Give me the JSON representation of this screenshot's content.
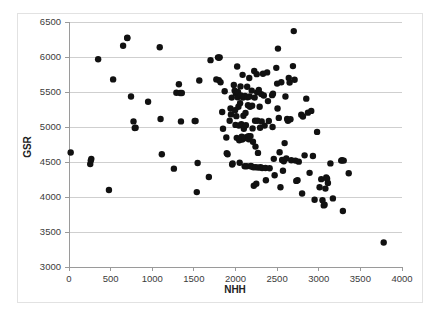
{
  "chart_data": {
    "type": "scatter",
    "title": "",
    "subtitle": "",
    "xlabel": "NHH",
    "ylabel": "GSR",
    "xlim": [
      0,
      4000
    ],
    "ylim": [
      3000,
      6500
    ],
    "xticks": [
      0,
      500,
      1000,
      1500,
      2000,
      2500,
      3000,
      3500,
      4000
    ],
    "yticks": [
      3000,
      3500,
      4000,
      4500,
      5000,
      5500,
      6000,
      6500
    ],
    "xtick_labels": [
      "0",
      "500",
      "1000",
      "1500",
      "2000",
      "2500",
      "3000",
      "3500",
      "4000"
    ],
    "ytick_labels": [
      "3000",
      "3500",
      "4000",
      "4500",
      "5000",
      "5500",
      "6000",
      "6500"
    ],
    "grid": "horizontal",
    "legend": "none",
    "marker": "filled-circle",
    "marker_color": "#111111",
    "marker_size": 3.2,
    "series": [
      {
        "name": "GSR vs NHH",
        "points": [
          [
            20,
            4635
          ],
          [
            255,
            4470
          ],
          [
            262,
            4520
          ],
          [
            268,
            4545
          ],
          [
            350,
            5968
          ],
          [
            480,
            4100
          ],
          [
            530,
            5680
          ],
          [
            650,
            6160
          ],
          [
            700,
            6275
          ],
          [
            700,
            6270
          ],
          [
            745,
            5435
          ],
          [
            775,
            5080
          ],
          [
            790,
            4985
          ],
          [
            800,
            4990
          ],
          [
            950,
            5360
          ],
          [
            1090,
            6140
          ],
          [
            1100,
            5115
          ],
          [
            1115,
            4610
          ],
          [
            1260,
            4405
          ],
          [
            1290,
            5490
          ],
          [
            1320,
            5610
          ],
          [
            1335,
            5485
          ],
          [
            1345,
            5080
          ],
          [
            1355,
            5485
          ],
          [
            1510,
            5085
          ],
          [
            1520,
            5085
          ],
          [
            1535,
            4070
          ],
          [
            1545,
            4485
          ],
          [
            1565,
            5665
          ],
          [
            1680,
            4285
          ],
          [
            1700,
            5955
          ],
          [
            1770,
            5680
          ],
          [
            1790,
            5995
          ],
          [
            1800,
            5990
          ],
          [
            1810,
            5995
          ],
          [
            1800,
            5670
          ],
          [
            1820,
            5640
          ],
          [
            1840,
            5215
          ],
          [
            1850,
            4975
          ],
          [
            1870,
            5510
          ],
          [
            1890,
            4850
          ],
          [
            1895,
            4625
          ],
          [
            1905,
            4610
          ],
          [
            1930,
            5090
          ],
          [
            1940,
            5265
          ],
          [
            1945,
            5180
          ],
          [
            1955,
            5420
          ],
          [
            1960,
            4465
          ],
          [
            1965,
            4480
          ],
          [
            1980,
            5600
          ],
          [
            1990,
            5520
          ],
          [
            1995,
            5240
          ],
          [
            2000,
            5030
          ],
          [
            2005,
            5480
          ],
          [
            2010,
            5155
          ],
          [
            2015,
            4845
          ],
          [
            2020,
            5865
          ],
          [
            2025,
            5425
          ],
          [
            2030,
            5500
          ],
          [
            2035,
            5290
          ],
          [
            2040,
            5020
          ],
          [
            2045,
            4810
          ],
          [
            2050,
            4490
          ],
          [
            2055,
            5340
          ],
          [
            2060,
            5580
          ],
          [
            2065,
            5450
          ],
          [
            2070,
            5040
          ],
          [
            2075,
            4860
          ],
          [
            2080,
            4820
          ],
          [
            2085,
            5745
          ],
          [
            2090,
            5420
          ],
          [
            2095,
            5160
          ],
          [
            2100,
            4975
          ],
          [
            2105,
            4840
          ],
          [
            2110,
            4440
          ],
          [
            2115,
            5445
          ],
          [
            2120,
            5200
          ],
          [
            2125,
            5025
          ],
          [
            2130,
            4855
          ],
          [
            2135,
            4440
          ],
          [
            2140,
            5575
          ],
          [
            2145,
            5425
          ],
          [
            2150,
            5310
          ],
          [
            2155,
            4870
          ],
          [
            2158,
            4835
          ],
          [
            2160,
            4825
          ],
          [
            2165,
            5700
          ],
          [
            2170,
            5435
          ],
          [
            2175,
            5290
          ],
          [
            2180,
            4870
          ],
          [
            2185,
            4445
          ],
          [
            2190,
            4435
          ],
          [
            2195,
            5520
          ],
          [
            2200,
            5305
          ],
          [
            2205,
            4980
          ],
          [
            2210,
            4790
          ],
          [
            2215,
            4425
          ],
          [
            2220,
            4160
          ],
          [
            2225,
            5800
          ],
          [
            2230,
            5420
          ],
          [
            2235,
            5090
          ],
          [
            2240,
            4720
          ],
          [
            2245,
            4425
          ],
          [
            2250,
            4190
          ],
          [
            2255,
            5755
          ],
          [
            2260,
            5495
          ],
          [
            2265,
            5090
          ],
          [
            2270,
            4630
          ],
          [
            2275,
            4420
          ],
          [
            2280,
            5530
          ],
          [
            2290,
            5290
          ],
          [
            2295,
            4990
          ],
          [
            2300,
            4425
          ],
          [
            2310,
            5470
          ],
          [
            2315,
            5080
          ],
          [
            2320,
            4415
          ],
          [
            2330,
            5760
          ],
          [
            2340,
            5450
          ],
          [
            2350,
            5020
          ],
          [
            2360,
            4415
          ],
          [
            2365,
            4240
          ],
          [
            2380,
            5780
          ],
          [
            2390,
            5370
          ],
          [
            2400,
            5085
          ],
          [
            2410,
            4410
          ],
          [
            2440,
            5455
          ],
          [
            2445,
            5000
          ],
          [
            2450,
            5475
          ],
          [
            2460,
            4545
          ],
          [
            2470,
            4310
          ],
          [
            2490,
            5845
          ],
          [
            2500,
            5620
          ],
          [
            2505,
            5265
          ],
          [
            2510,
            6120
          ],
          [
            2520,
            5130
          ],
          [
            2530,
            4640
          ],
          [
            2540,
            4140
          ],
          [
            2550,
            5640
          ],
          [
            2560,
            4530
          ],
          [
            2570,
            4375
          ],
          [
            2580,
            4510
          ],
          [
            2590,
            4770
          ],
          [
            2600,
            5435
          ],
          [
            2610,
            4550
          ],
          [
            2620,
            5115
          ],
          [
            2630,
            5090
          ],
          [
            2640,
            5700
          ],
          [
            2650,
            5635
          ],
          [
            2660,
            5110
          ],
          [
            2670,
            4525
          ],
          [
            2690,
            5870
          ],
          [
            2700,
            6370
          ],
          [
            2710,
            5675
          ],
          [
            2720,
            4520
          ],
          [
            2730,
            4230
          ],
          [
            2745,
            4240
          ],
          [
            2760,
            4505
          ],
          [
            2790,
            5175
          ],
          [
            2800,
            4050
          ],
          [
            2810,
            5150
          ],
          [
            2830,
            4595
          ],
          [
            2850,
            5405
          ],
          [
            2870,
            5205
          ],
          [
            2890,
            4345
          ],
          [
            2910,
            5230
          ],
          [
            2930,
            4585
          ],
          [
            2950,
            3960
          ],
          [
            2980,
            4930
          ],
          [
            3010,
            4140
          ],
          [
            3030,
            4255
          ],
          [
            3045,
            3955
          ],
          [
            3060,
            3880
          ],
          [
            3070,
            3890
          ],
          [
            3080,
            4120
          ],
          [
            3090,
            4280
          ],
          [
            3100,
            4260
          ],
          [
            3110,
            4200
          ],
          [
            3140,
            4480
          ],
          [
            3170,
            3980
          ],
          [
            3270,
            4520
          ],
          [
            3280,
            4525
          ],
          [
            3290,
            3800
          ],
          [
            3300,
            4520
          ],
          [
            3360,
            4340
          ],
          [
            3780,
            3350
          ]
        ]
      }
    ]
  }
}
